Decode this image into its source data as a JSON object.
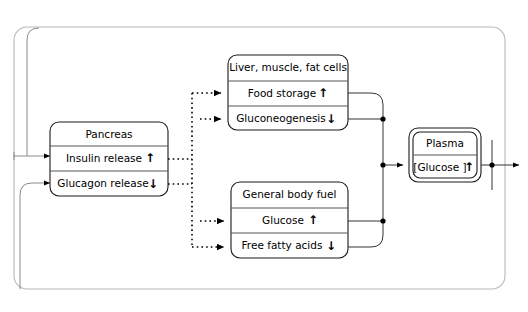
{
  "diagram": {
    "nodes": [
      {
        "id": "pancreas",
        "header": "Pancreas",
        "rows": [
          {
            "label": "Insulin release",
            "direction": "up",
            "arrow": "↑"
          },
          {
            "label": "Glucagon release",
            "direction": "down",
            "arrow": "↓"
          }
        ]
      },
      {
        "id": "liver",
        "header": "Liver, muscle, fat cells",
        "rows": [
          {
            "label": "Food storage",
            "direction": "up",
            "arrow": "↑"
          },
          {
            "label": "Gluconeogenesis",
            "direction": "down",
            "arrow": "↓"
          }
        ]
      },
      {
        "id": "general-body-fuel",
        "header": "General body fuel",
        "rows": [
          {
            "label": "Glucose",
            "direction": "up",
            "arrow": "↑"
          },
          {
            "label": "Free fatty acids",
            "direction": "down",
            "arrow": "↓"
          }
        ]
      },
      {
        "id": "plasma",
        "header": "Plasma",
        "rows": [
          {
            "label": "[Glucose ]",
            "direction": "up",
            "arrow": "↑"
          }
        ]
      }
    ],
    "colors": {
      "node_border": "#1a1a1a",
      "divider": "#555555",
      "outer_frame": "#b8b8b8",
      "solid_link": "#333333",
      "dotted_link": "#000000",
      "input_curve": "#8a8a8a",
      "background": "#ffffff"
    }
  }
}
